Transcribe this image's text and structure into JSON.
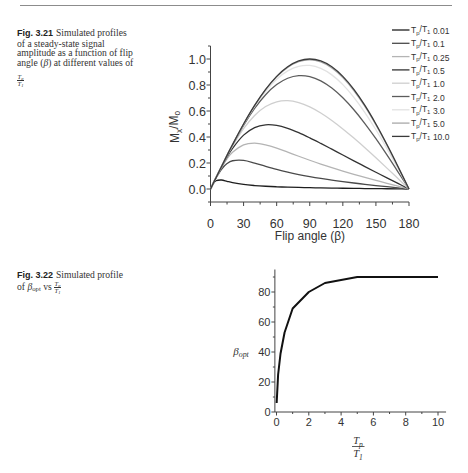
{
  "captions": {
    "fig321": {
      "label": "Fig. 3.21",
      "line1": "Simulated profiles",
      "line2": "of a steady-state signal",
      "line3": "amplitude as a function of flip",
      "line4_pre": "angle (",
      "line4_beta": "β",
      "line4_post": ") at different values of",
      "frac": {
        "num": "T",
        "num_sub": "p",
        "den": "T",
        "den_sub": "1"
      }
    },
    "fig322": {
      "label": "Fig. 3.22",
      "line1": "Simulated profile",
      "line2_pre": "of ",
      "beta": "β",
      "beta_sub": "opt",
      "vs": " vs ",
      "frac": {
        "num": "T",
        "num_sub": "p",
        "den": "T",
        "den_sub": "1"
      }
    }
  },
  "chart_data": [
    {
      "id": "fig-3-21",
      "type": "line",
      "title": "",
      "xlabel": "Flip angle (β)",
      "ylabel": "Mx/Mo",
      "ylabel_parts": [
        {
          "t": "M"
        },
        {
          "t": "x",
          "sub": true
        },
        {
          "t": "/M"
        },
        {
          "t": "o",
          "sub": true
        }
      ],
      "xlim": [
        0,
        180
      ],
      "ylim": [
        -0.1,
        1.1
      ],
      "xticks": [
        0,
        30,
        60,
        90,
        120,
        150,
        180
      ],
      "xtick_labels": [
        "0",
        "30",
        "60",
        "90",
        "120",
        "150",
        "180"
      ],
      "yticks": [
        0,
        0.2,
        0.4,
        0.6,
        0.8,
        1.0
      ],
      "ytick_labels": [
        "0.0",
        "0.2",
        "0.4",
        "0.6",
        "0.8",
        "1.0"
      ],
      "grid": false,
      "legend_position": "top-right",
      "legend_prefix_parts": [
        {
          "t": "T"
        },
        {
          "t": "p",
          "sub": true
        },
        {
          "t": "/T"
        },
        {
          "t": "1",
          "sub": true
        }
      ],
      "x": [
        0,
        2.5,
        5,
        10,
        15,
        20,
        30,
        40,
        50,
        60,
        70,
        80,
        90,
        100,
        110,
        120,
        130,
        140,
        150,
        160,
        170,
        180
      ],
      "series": [
        {
          "name": "Tp/T1 0.01",
          "value_label": "0.01",
          "color": "#1e1e1e",
          "values": [
            0,
            0.0399,
            0.0632,
            0.0691,
            0.059,
            0.0489,
            0.0349,
            0.0265,
            0.021,
            0.0171,
            0.0141,
            0.0118,
            0.01,
            0.0084,
            0.007,
            0.0058,
            0.0047,
            0.0036,
            0.0027,
            0.0018,
            0.0009,
            0
          ]
        },
        {
          "name": "Tp/T1 0.1",
          "value_label": "0.1",
          "color": "#4a4a4a",
          "values": [
            0,
            0.0432,
            0.0841,
            0.1517,
            0.1955,
            0.2174,
            0.2199,
            0.1993,
            0.1742,
            0.1505,
            0.1295,
            0.1112,
            0.0952,
            0.081,
            0.0683,
            0.0567,
            0.0461,
            0.0361,
            0.0267,
            0.0176,
            0.0087,
            0
          ]
        },
        {
          "name": "Tp/T1 0.25",
          "value_label": "0.25",
          "color": "#b4b4b4",
          "values": [
            0,
            0.0435,
            0.086,
            0.1648,
            0.2311,
            0.2821,
            0.3398,
            0.3525,
            0.3393,
            0.3137,
            0.2833,
            0.2519,
            0.2212,
            0.1919,
            0.1641,
            0.1379,
            0.1129,
            0.0891,
            0.0661,
            0.0437,
            0.0217,
            0
          ]
        },
        {
          "name": "Tp/T1 0.5",
          "value_label": "0.5",
          "color": "#333333",
          "values": [
            0,
            0.0436,
            0.0867,
            0.1697,
            0.2459,
            0.3129,
            0.4144,
            0.4724,
            0.494,
            0.4891,
            0.4665,
            0.4331,
            0.3935,
            0.3506,
            0.3062,
            0.2615,
            0.2169,
            0.1727,
            0.129,
            0.0857,
            0.0428,
            0
          ]
        },
        {
          "name": "Tp/T1 1.0",
          "value_label": "1.0",
          "color": "#cfcfcf",
          "values": [
            0,
            0.0436,
            0.087,
            0.1721,
            0.2538,
            0.3304,
            0.4638,
            0.5658,
            0.6342,
            0.6708,
            0.6795,
            0.665,
            0.6321,
            0.5851,
            0.5276,
            0.4624,
            0.3916,
            0.317,
            0.2397,
            0.1607,
            0.0806,
            0
          ]
        },
        {
          "name": "Tp/T1 2.0",
          "value_label": "2.0",
          "color": "#5c5c5c",
          "values": [
            0,
            0.0436,
            0.0871,
            0.1732,
            0.2574,
            0.3388,
            0.4897,
            0.6201,
            0.7255,
            0.8032,
            0.852,
            0.872,
            0.8647,
            0.832,
            0.7766,
            0.7014,
            0.6094,
            0.5036,
            0.387,
            0.2624,
            0.1325,
            0
          ]
        },
        {
          "name": "Tp/T1 3.0",
          "value_label": "3.0",
          "color": "#e2e2e2",
          "values": [
            0,
            0.0436,
            0.0871,
            0.1735,
            0.2584,
            0.3409,
            0.4965,
            0.635,
            0.752,
            0.8439,
            0.9084,
            0.9439,
            0.9502,
            0.9278,
            0.878,
            0.8029,
            0.7053,
            0.5883,
            0.4555,
            0.3105,
            0.1573,
            0
          ]
        },
        {
          "name": "Tp/T1 5.0",
          "value_label": "5.0",
          "color": "#a8a8a8",
          "values": [
            0,
            0.0436,
            0.0872,
            0.1736,
            0.2588,
            0.3419,
            0.4996,
            0.6418,
            0.7642,
            0.8631,
            0.9355,
            0.9793,
            0.9933,
            0.977,
            0.9312,
            0.8573,
            0.7576,
            0.6352,
            0.4937,
            0.3376,
            0.1713,
            0
          ]
        },
        {
          "name": "Tp/T1 10.0",
          "value_label": "10.0",
          "color": "#3a3a3a",
          "values": [
            0,
            0.0436,
            0.0872,
            0.1736,
            0.2588,
            0.342,
            0.5,
            0.6428,
            0.766,
            0.866,
            0.9397,
            0.9848,
            1.0,
            0.9848,
            0.9397,
            0.866,
            0.766,
            0.6428,
            0.5,
            0.342,
            0.1736,
            0
          ]
        }
      ]
    },
    {
      "id": "fig-3-22",
      "type": "line",
      "title": "",
      "xlabel": "Tp/T1",
      "xlabel_frac": {
        "num": "T",
        "num_sub": "p",
        "den": "T",
        "den_sub": "1"
      },
      "ylabel": "β_opt",
      "ylabel_parts": [
        {
          "t": "β"
        },
        {
          "t": "opt",
          "sub": true
        }
      ],
      "xlim": [
        -0.1,
        10.5
      ],
      "ylim": [
        0,
        95
      ],
      "xticks": [
        0,
        2,
        4,
        6,
        8,
        10
      ],
      "xtick_labels": [
        "0",
        "2",
        "4",
        "6",
        "8",
        "10"
      ],
      "yticks": [
        0,
        20,
        40,
        60,
        80
      ],
      "ytick_labels": [
        "0",
        "20",
        "40",
        "60",
        "80"
      ],
      "grid": false,
      "legend_position": "none",
      "x": [
        0.01,
        0.1,
        0.25,
        0.5,
        1,
        2,
        3,
        5,
        10
      ],
      "series": [
        {
          "name": "beta_opt",
          "color": "#111111",
          "values": [
            6,
            25,
            39,
            53,
            69,
            80,
            86,
            90,
            90
          ]
        }
      ]
    }
  ]
}
